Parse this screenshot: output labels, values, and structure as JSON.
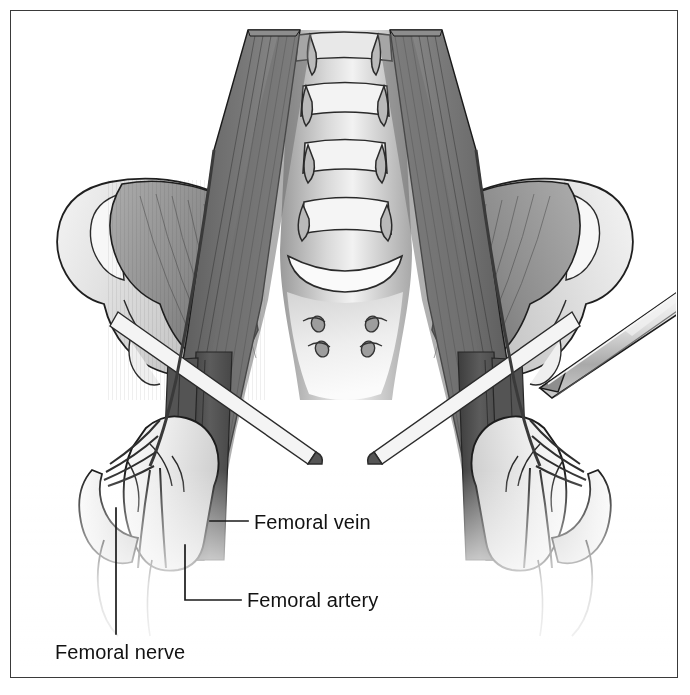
{
  "figure": {
    "kind": "anatomical-illustration",
    "style": "grayscale line-and-tone medical drawing",
    "border_color": "#3a3a3a",
    "background_color": "#ffffff"
  },
  "labels": [
    {
      "id": "femoral-vein",
      "text": "Femoral vein",
      "leader": {
        "from_x": 210,
        "from_y": 521,
        "elbow_x": 246,
        "elbow_y": 521
      }
    },
    {
      "id": "femoral-artery",
      "text": "Femoral artery",
      "leader": {
        "from_x": 185,
        "from_y": 545,
        "elbow_x": 185,
        "elbow_y": 600,
        "to_x": 240,
        "to_y": 600
      }
    },
    {
      "id": "femoral-nerve",
      "text": "Femoral nerve",
      "leader": {
        "from_x": 116,
        "from_y": 508,
        "elbow_x": 116,
        "elbow_y": 633
      }
    }
  ],
  "structures": {
    "spine": "lumbar vertebral bodies",
    "sacrum": "sacrum with four anterior sacral foramina",
    "ilium_left": "left iliac crest and iliac fossa",
    "ilium_right": "right iliac crest and iliac fossa",
    "psoas": "psoas major muscles",
    "iliacus": "iliacus muscles",
    "femur_left": "left proximal femur (head, neck, greater trochanter)",
    "femur_right": "right proximal femur (head, neck, greater trochanter)",
    "inguinal_ligament": "cut inguinal ligaments",
    "needle": "block needle directed at right femoral nerve"
  },
  "tones": {
    "muscle_dark": "#5e5e5e",
    "muscle_mid": "#8a8a8a",
    "muscle_light": "#b4b4b4",
    "bone_light": "#f0f0f0",
    "bone_shade": "#d6d6d6",
    "outline": "#1c1c1c",
    "vessel_dark": "#4b4b4b",
    "nerve": "#cfcfcf",
    "needle": "#d8d8d8"
  }
}
